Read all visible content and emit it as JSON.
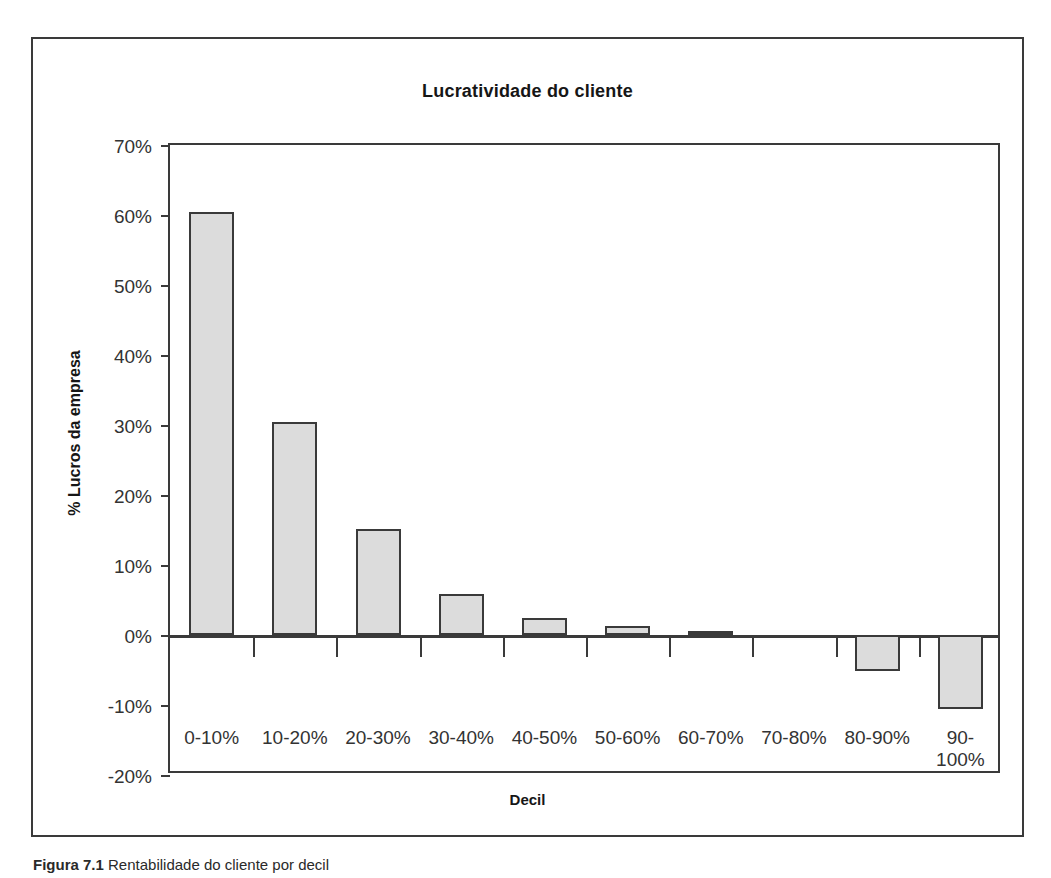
{
  "figure": {
    "caption_label": "Figura 7.1",
    "caption_text": "Rentabilidade do cliente por decil"
  },
  "chart_data": {
    "type": "bar",
    "title": "Lucratividade do cliente",
    "xlabel": "Decil",
    "ylabel": "% Lucros da empresa",
    "categories": [
      "0-10%",
      "10-20%",
      "20-30%",
      "30-40%",
      "40-50%",
      "50-60%",
      "60-70%",
      "70-80%",
      "80-90%",
      "90-100%"
    ],
    "values": [
      60.4,
      30.4,
      15.1,
      5.8,
      2.5,
      1.3,
      0.6,
      0.0,
      -5.1,
      -10.5
    ],
    "ylim": [
      -20,
      70
    ],
    "ytick_labels": [
      "70%",
      "60%",
      "50%",
      "40%",
      "30%",
      "20%",
      "10%",
      "0%",
      "-10%",
      "-20%"
    ],
    "ytick_values": [
      70,
      60,
      50,
      40,
      30,
      20,
      10,
      0,
      -10,
      -20
    ],
    "grid": false,
    "legend": "none",
    "bar_fill_color": "#dcdcdc",
    "bar_border_color": "#3a3a3a",
    "axis_color": "#3a3a3a"
  }
}
